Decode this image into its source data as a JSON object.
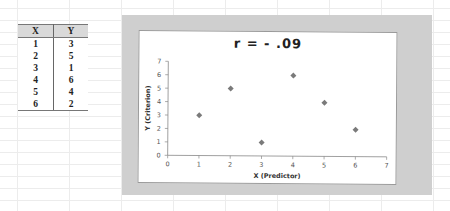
{
  "table": {
    "headers": [
      "X",
      "Y"
    ],
    "rows": [
      [
        "1",
        "3"
      ],
      [
        "2",
        "5"
      ],
      [
        "3",
        "1"
      ],
      [
        "4",
        "6"
      ],
      [
        "5",
        "4"
      ],
      [
        "6",
        "2"
      ]
    ]
  },
  "chart_data": {
    "type": "scatter",
    "title": "r  =  - .09",
    "xlabel": "X (Predictor)",
    "ylabel": "Y (Criterion)",
    "x": [
      1,
      2,
      3,
      4,
      5,
      6
    ],
    "y": [
      3,
      5,
      1,
      6,
      4,
      2
    ],
    "xlim": [
      0,
      7
    ],
    "ylim": [
      0,
      7
    ],
    "xticks": [
      "0",
      "1",
      "2",
      "3",
      "4",
      "5",
      "6",
      "7"
    ],
    "yticks": [
      "0",
      "1",
      "2",
      "3",
      "4",
      "5",
      "6",
      "7"
    ],
    "grid": false,
    "legend": null,
    "marker": "diamond",
    "marker_color": "#7a7a7a"
  },
  "colors": {
    "chart_frame": "#cfcfcf",
    "plot_background": "#ffffff",
    "table_header": "#d9d9d9"
  }
}
